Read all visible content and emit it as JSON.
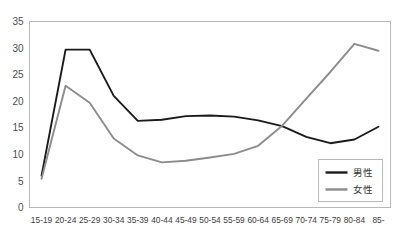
{
  "chart_data": {
    "type": "line",
    "title": "",
    "xlabel": "",
    "ylabel": "",
    "ylim": [
      0,
      35
    ],
    "ytick_step": 5,
    "yticks": [
      "0",
      "5",
      "10",
      "15",
      "20",
      "25",
      "30",
      "35"
    ],
    "grid": false,
    "legend_position": "bottom-right",
    "categories": [
      "15-19",
      "20-24",
      "25-29",
      "30-34",
      "35-39",
      "40-44",
      "45-49",
      "50-54",
      "55-59",
      "60-64",
      "65-69",
      "70-74",
      "75-79",
      "80-84",
      "85-"
    ],
    "series": [
      {
        "name": "男性",
        "color": "#1a1a1a",
        "values": [
          6.0,
          29.7,
          29.7,
          21.0,
          16.3,
          16.5,
          17.2,
          17.3,
          17.1,
          16.4,
          15.3,
          13.3,
          12.1,
          12.8,
          15.2
        ]
      },
      {
        "name": "女性",
        "color": "#8c8c8c",
        "values": [
          5.4,
          22.9,
          19.7,
          13.0,
          9.8,
          8.5,
          8.8,
          9.4,
          10.1,
          11.6,
          15.4,
          20.5,
          25.5,
          30.8,
          29.5
        ]
      }
    ]
  },
  "legend": {
    "items": [
      {
        "label": "男性",
        "color": "#1a1a1a"
      },
      {
        "label": "女性",
        "color": "#8c8c8c"
      }
    ]
  },
  "axis": {
    "y_min_label": "0",
    "y_max_label": "35"
  },
  "colors": {
    "male_line": "#1a1a1a",
    "female_line": "#8c8c8c",
    "plot_border": "#b8b8b8",
    "axis_text": "#4d4d4d",
    "background": "#ffffff"
  }
}
